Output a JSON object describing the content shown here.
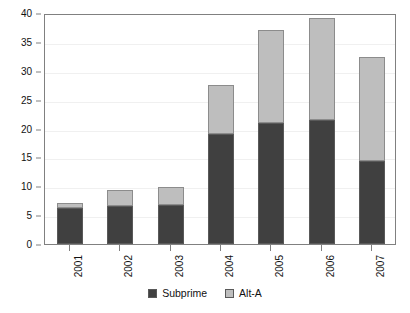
{
  "chart_data": {
    "type": "bar",
    "subtype": "stacked-bar",
    "title": "",
    "xlabel": "",
    "ylabel": "",
    "categories": [
      "2001",
      "2002",
      "2003",
      "2004",
      "2005",
      "2006",
      "2007"
    ],
    "series": [
      {
        "name": "Subprime",
        "color": "#404040",
        "values": [
          6.2,
          6.5,
          6.8,
          19.0,
          21.0,
          21.5,
          14.3
        ]
      },
      {
        "name": "Alt-A",
        "color": "#bebebe",
        "values": [
          0.9,
          2.9,
          3.1,
          8.6,
          16.0,
          17.7,
          18.0
        ]
      }
    ],
    "totals": [
      7.1,
      9.4,
      9.9,
      27.6,
      37.0,
      39.2,
      32.3
    ],
    "ylim": [
      0,
      40
    ],
    "yticks": [
      0,
      5,
      10,
      15,
      20,
      25,
      30,
      35,
      40
    ],
    "ytick_labels": [
      "0",
      "5",
      "10",
      "15",
      "20",
      "25",
      "30",
      "35",
      "40"
    ],
    "grid": true,
    "legend_position": "bottom",
    "frame": true,
    "xtick_rotation": 90
  },
  "legend": {
    "items": [
      {
        "label": "Subprime",
        "color": "#404040"
      },
      {
        "label": "Alt-A",
        "color": "#bebebe"
      }
    ]
  }
}
